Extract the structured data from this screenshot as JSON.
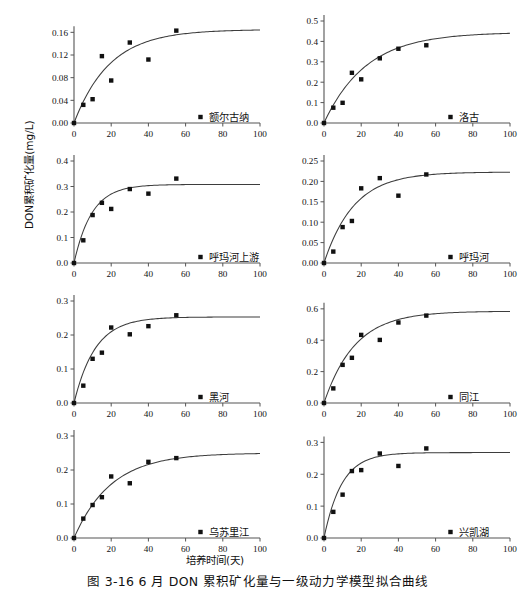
{
  "figure": {
    "caption": "图 3-16   6 月 DON 累积矿化量与一级动力学模型拟合曲线",
    "y_axis_title": "DON累积矿化量(mg/L)",
    "x_axis_title": "培养时间(天)",
    "marker_color": "#111111",
    "curve_color": "#3d3d3d",
    "axis_color": "#555555"
  },
  "chart_data": [
    {
      "type": "scatter",
      "title": "额尔古纳",
      "legend": "额尔古纳",
      "xlabel": "培养时间(天)",
      "ylabel": "DON累积矿化量(mg/L)",
      "xlim": [
        0,
        100
      ],
      "ylim": [
        0,
        0.18
      ],
      "xticks": [
        0,
        20,
        40,
        60,
        80,
        100
      ],
      "yticks": [
        0.0,
        0.04,
        0.08,
        0.12,
        0.16
      ],
      "ytick_labels": [
        "0.00",
        "0.04",
        "0.08",
        "0.12",
        "0.16"
      ],
      "grid": false,
      "legend_position": "bottom-right",
      "x": [
        0,
        5,
        10,
        15,
        20,
        30,
        40,
        55
      ],
      "values": [
        0.0,
        0.032,
        0.042,
        0.118,
        0.075,
        0.142,
        0.112,
        0.163
      ],
      "fit_curve": {
        "model": "first-order",
        "N0": 0.165,
        "k": 0.052
      }
    },
    {
      "type": "scatter",
      "title": "洛古",
      "legend": "洛古",
      "xlabel": "培养时间(天)",
      "ylabel": "DON累积矿化量(mg/L)",
      "xlim": [
        0,
        100
      ],
      "ylim": [
        0,
        0.5
      ],
      "xticks": [
        0,
        20,
        40,
        60,
        80,
        100
      ],
      "yticks": [
        0.0,
        0.1,
        0.2,
        0.3,
        0.4,
        0.5
      ],
      "ytick_labels": [
        "0.0",
        "0.1",
        "0.2",
        "0.3",
        "0.4",
        "0.5"
      ],
      "grid": false,
      "legend_position": "bottom-right",
      "x": [
        0,
        5,
        10,
        15,
        20,
        30,
        40,
        55
      ],
      "values": [
        0.0,
        0.075,
        0.099,
        0.246,
        0.214,
        0.317,
        0.364,
        0.381
      ],
      "fit_curve": {
        "model": "first-order",
        "N0": 0.445,
        "k": 0.044
      }
    },
    {
      "type": "scatter",
      "title": "呼玛河上游",
      "legend": "呼玛河上游",
      "xlabel": "培养时间(天)",
      "ylabel": "DON累积矿化量(mg/L)",
      "xlim": [
        0,
        100
      ],
      "ylim": [
        0,
        0.4
      ],
      "xticks": [
        0,
        20,
        40,
        60,
        80,
        100
      ],
      "yticks": [
        0.0,
        0.1,
        0.2,
        0.3,
        0.4
      ],
      "ytick_labels": [
        "0.0",
        "0.1",
        "0.2",
        "0.3",
        "0.4"
      ],
      "grid": false,
      "legend_position": "bottom-right",
      "x": [
        0,
        5,
        10,
        15,
        20,
        30,
        40,
        55
      ],
      "values": [
        0.0,
        0.089,
        0.188,
        0.236,
        0.212,
        0.29,
        0.272,
        0.331
      ],
      "fit_curve": {
        "model": "first-order",
        "N0": 0.308,
        "k": 0.105
      }
    },
    {
      "type": "scatter",
      "title": "呼玛河",
      "legend": "呼玛河",
      "xlabel": "培养时间(天)",
      "ylabel": "DON累积矿化量(mg/L)",
      "xlim": [
        0,
        100
      ],
      "ylim": [
        0,
        0.25
      ],
      "xticks": [
        0,
        20,
        40,
        60,
        80,
        100
      ],
      "yticks": [
        0.0,
        0.05,
        0.1,
        0.15,
        0.2,
        0.25
      ],
      "ytick_labels": [
        "0.00",
        "0.05",
        "0.10",
        "0.15",
        "0.20",
        "0.25"
      ],
      "grid": false,
      "legend_position": "bottom-right",
      "x": [
        0,
        5,
        10,
        15,
        20,
        30,
        40,
        55
      ],
      "values": [
        0.0,
        0.028,
        0.088,
        0.103,
        0.183,
        0.208,
        0.165,
        0.217
      ],
      "fit_curve": {
        "model": "first-order",
        "N0": 0.223,
        "k": 0.062
      }
    },
    {
      "type": "scatter",
      "title": "黑河",
      "legend": "黑河",
      "xlabel": "培养时间(天)",
      "ylabel": "DON累积矿化量(mg/L)",
      "xlim": [
        0,
        100
      ],
      "ylim": [
        0,
        0.3
      ],
      "xticks": [
        0,
        20,
        40,
        60,
        80,
        100
      ],
      "yticks": [
        0.0,
        0.1,
        0.2,
        0.3
      ],
      "ytick_labels": [
        "0.0",
        "0.1",
        "0.2",
        "0.3"
      ],
      "grid": false,
      "legend_position": "bottom-right",
      "x": [
        0,
        5,
        10,
        15,
        20,
        30,
        40,
        55
      ],
      "values": [
        0.0,
        0.051,
        0.13,
        0.148,
        0.222,
        0.202,
        0.226,
        0.258
      ],
      "fit_curve": {
        "model": "first-order",
        "N0": 0.253,
        "k": 0.088
      }
    },
    {
      "type": "scatter",
      "title": "同江",
      "legend": "同江",
      "xlabel": "培养时间(天)",
      "ylabel": "DON累积矿化量(mg/L)",
      "xlim": [
        0,
        100
      ],
      "ylim": [
        0,
        0.65
      ],
      "xticks": [
        0,
        20,
        40,
        60,
        80,
        100
      ],
      "yticks": [
        0.0,
        0.2,
        0.4,
        0.6
      ],
      "ytick_labels": [
        "0.0",
        "0.2",
        "0.4",
        "0.6"
      ],
      "grid": false,
      "legend_position": "bottom-right",
      "x": [
        0,
        5,
        10,
        15,
        20,
        30,
        40,
        55
      ],
      "values": [
        0.0,
        0.093,
        0.243,
        0.288,
        0.434,
        0.402,
        0.513,
        0.557
      ],
      "fit_curve": {
        "model": "first-order",
        "N0": 0.585,
        "k": 0.06
      }
    },
    {
      "type": "scatter",
      "title": "乌苏里江",
      "legend": "乌苏里江",
      "xlabel": "培养时间(天)",
      "ylabel": "DON累积矿化量(mg/L)",
      "xlim": [
        0,
        100
      ],
      "ylim": [
        0,
        0.3
      ],
      "xticks": [
        0,
        20,
        40,
        60,
        80,
        100
      ],
      "yticks": [
        0.0,
        0.1,
        0.2,
        0.3
      ],
      "ytick_labels": [
        "0.0",
        "0.1",
        "0.2",
        "0.3"
      ],
      "grid": false,
      "legend_position": "bottom-right",
      "x": [
        0,
        5,
        10,
        15,
        20,
        30,
        40,
        55
      ],
      "values": [
        0.0,
        0.057,
        0.097,
        0.12,
        0.181,
        0.161,
        0.224,
        0.235
      ],
      "fit_curve": {
        "model": "first-order",
        "N0": 0.25,
        "k": 0.05
      }
    },
    {
      "type": "scatter",
      "title": "兴凯湖",
      "legend": "兴凯湖",
      "xlabel": "培养时间(天)",
      "ylabel": "DON累积矿化量(mg/L)",
      "xlim": [
        0,
        100
      ],
      "ylim": [
        0,
        0.32
      ],
      "xticks": [
        0,
        20,
        40,
        60,
        80,
        100
      ],
      "yticks": [
        0.0,
        0.1,
        0.2,
        0.3
      ],
      "ytick_labels": [
        "0.0",
        "0.1",
        "0.2",
        "0.3"
      ],
      "grid": false,
      "legend_position": "bottom-right",
      "x": [
        0,
        5,
        10,
        15,
        20,
        30,
        40,
        55
      ],
      "values": [
        0.0,
        0.082,
        0.136,
        0.21,
        0.213,
        0.265,
        0.226,
        0.281
      ],
      "fit_curve": {
        "model": "first-order",
        "N0": 0.268,
        "k": 0.105
      }
    }
  ]
}
